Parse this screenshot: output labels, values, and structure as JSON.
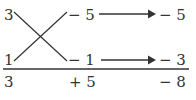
{
  "diagram": {
    "type": "cross-multiplication factoring",
    "left_column": {
      "top": "3",
      "bottom": "1"
    },
    "middle_column": {
      "top": "− 5",
      "bottom": "− 1"
    },
    "right_column": {
      "top": "− 5",
      "bottom": "− 3"
    },
    "totals": {
      "left": "3",
      "middle": "+ 5",
      "right": "− 8"
    },
    "colors": {
      "stroke": "#333333",
      "text": "#333333"
    }
  }
}
